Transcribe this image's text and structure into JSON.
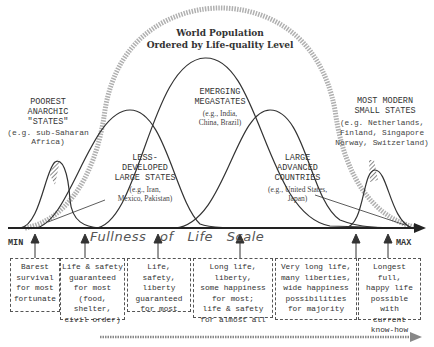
{
  "title": {
    "line1": "World Population",
    "line2": "Ordered by Life-quality Level"
  },
  "groups": [
    {
      "id": "poorest",
      "name": "POOREST\nANARCHIC\n\"STATES\"",
      "example": "(e.g. sub-Saharan\nAfrica)"
    },
    {
      "id": "less-developed",
      "name": "LESS-\nDEVELOPED\nLARGE STATES",
      "example": "(e.g., Iran,\nMexico, Pakistan)"
    },
    {
      "id": "emerging",
      "name": "EMERGING\nMEGASTATES",
      "example": "(e.g., India,\nChina, Brazil)"
    },
    {
      "id": "large-advanced",
      "name": "LARGE\nADVANCED\nCOUNTRIES",
      "example": "(e.g., United States,\nJapan)"
    },
    {
      "id": "most-modern",
      "name": "MOST MODERN\nSMALL STATES",
      "example": "(e.g. Netherlands,\nFinland, Singapore\nNorway, Switzerland)"
    }
  ],
  "axis": {
    "label": "Fullness   of   Life   Scale",
    "min": "MIN",
    "max": "MAX"
  },
  "levels": [
    "Barest\nsurvival\nfor most\nfortunate",
    "Life & safety\nguaranteed\nfor most\n(food, shelter,\ncivil order)",
    "Life, safety,\nliberty\nguaranteed\nfor most",
    "Long life, liberty,\nsome happiness\nfor most;\nlife & safety\nfor almost all",
    "Very long life,\nmany liberties,\nwide happiness\npossibilities\nfor majority",
    "Longest full,\nhappy life\npossible with\ncurrent\nknow-how"
  ],
  "colors": {
    "line": "#333333",
    "dotted": "#9a9a9a",
    "background": "#ffffff"
  }
}
